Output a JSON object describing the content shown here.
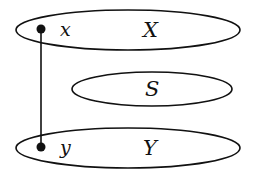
{
  "diagram": {
    "sets": [
      {
        "id": "X",
        "label": "X",
        "cx": 128,
        "cy": 30,
        "rx": 112,
        "ry": 20
      },
      {
        "id": "S",
        "label": "S",
        "cx": 152,
        "cy": 89,
        "rx": 80,
        "ry": 17
      },
      {
        "id": "Y",
        "label": "Y",
        "cx": 128,
        "cy": 148,
        "rx": 112,
        "ry": 20
      }
    ],
    "points": [
      {
        "id": "x",
        "label": "x",
        "set": "X",
        "cx": 41,
        "cy": 29
      },
      {
        "id": "y",
        "label": "y",
        "set": "Y",
        "cx": 41,
        "cy": 147
      }
    ],
    "edges": [
      {
        "from": "x",
        "to": "y"
      }
    ],
    "colors": {
      "stroke": "#111111",
      "background": "#ffffff"
    }
  }
}
